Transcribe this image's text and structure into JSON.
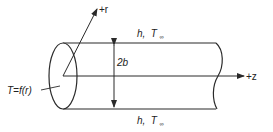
{
  "diagram": {
    "labels": {
      "r_axis": "+r",
      "z_axis": "+z",
      "diameter": "2b",
      "temperature": "T=f(r)",
      "top_bc_h": "h,",
      "top_bc_T": "T",
      "top_bc_sub": "∞",
      "bottom_bc_h": "h,",
      "bottom_bc_T": "T",
      "bottom_bc_sub": "∞"
    },
    "colors": {
      "line": "#2a2a2a",
      "text": "#222222"
    }
  }
}
